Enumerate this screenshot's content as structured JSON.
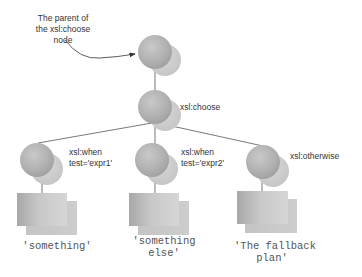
{
  "diagram": {
    "annotation": {
      "lines": [
        "The parent of",
        "the xsl:choose",
        "node"
      ]
    },
    "nodes": {
      "parent": {
        "label": ""
      },
      "choose": {
        "label": "xsl:choose"
      },
      "when1": {
        "label_lines": [
          "xsl:when",
          "test='expr1'"
        ]
      },
      "when2": {
        "label_lines": [
          "xsl:when",
          "test='expr2'"
        ]
      },
      "otherwise": {
        "label": "xsl:otherwise"
      }
    },
    "results": {
      "when1": {
        "lines": [
          "'something'"
        ]
      },
      "when2": {
        "lines": [
          "'something",
          "else'"
        ]
      },
      "otherwise": {
        "lines": [
          "'The fallback",
          "plan'"
        ]
      }
    },
    "colors": {
      "sphere": "#b4b4b4",
      "sphere_shadow": "#cdcdcd",
      "box": "#bdbdbd",
      "box_shadow": "#cfcfcf",
      "line": "#555555"
    }
  }
}
